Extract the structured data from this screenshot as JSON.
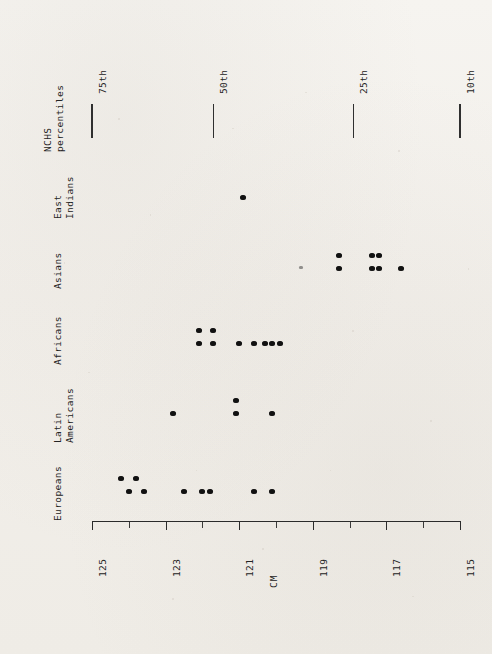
{
  "chart_data": {
    "type": "scatter",
    "title": "",
    "xlabel": "CM",
    "ylabel": "",
    "orientation": "horizontal-rotated",
    "axis": {
      "name": "CM",
      "min": 115,
      "max": 125,
      "major_ticks": [
        125,
        123,
        121,
        119,
        117,
        115
      ],
      "major_tick_labels": [
        "125",
        "123",
        "121",
        "119",
        "117",
        "115"
      ],
      "minor_tick_step": 1,
      "grid": false,
      "direction": "descending"
    },
    "groups": [
      {
        "name": "Europeans",
        "label_lines": [
          "Europeans"
        ],
        "n": 9,
        "values": [
          124.2,
          124.0,
          123.8,
          123.6,
          122.5,
          122.0,
          121.8,
          120.6,
          120.1
        ],
        "row_offsets": [
          1,
          0,
          1,
          0,
          0,
          0,
          0,
          0,
          0
        ]
      },
      {
        "name": "Latin Americans",
        "label_lines": [
          "Latin",
          "Americans"
        ],
        "n": 4,
        "values": [
          122.8,
          121.1,
          121.1,
          120.1
        ],
        "row_offsets": [
          0,
          1,
          0,
          0
        ]
      },
      {
        "name": "Africans",
        "label_lines": [
          "Africans"
        ],
        "n": 9,
        "values": [
          122.1,
          122.1,
          121.7,
          121.7,
          121.0,
          120.6,
          120.3,
          120.1,
          119.9
        ],
        "row_offsets": [
          1,
          0,
          1,
          0,
          0,
          0,
          0,
          0,
          0
        ]
      },
      {
        "name": "Asians",
        "label_lines": [
          "Asians"
        ],
        "n": 8,
        "values": [
          119.3,
          118.3,
          118.3,
          117.4,
          117.4,
          117.2,
          117.2,
          116.6
        ],
        "row_offsets": [
          0,
          1,
          0,
          1,
          0,
          1,
          0,
          0
        ]
      },
      {
        "name": "East Indians",
        "label_lines": [
          "East",
          "Indians"
        ],
        "n": 1,
        "values": [
          120.9
        ],
        "row_offsets": [
          0
        ]
      }
    ],
    "reference_markers": {
      "name": "NCHS percentiles",
      "label_lines": [
        "NCHS",
        "percentiles"
      ],
      "entries": [
        {
          "label": "75th",
          "value": 125.0
        },
        {
          "label": "50th",
          "value": 121.7
        },
        {
          "label": "25th",
          "value": 117.9
        },
        {
          "label": "10th",
          "value": 115.0
        }
      ]
    }
  }
}
